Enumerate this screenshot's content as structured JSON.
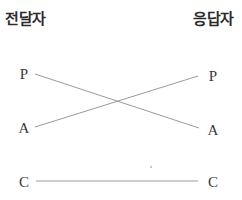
{
  "diagram": {
    "left_title": "전달자",
    "right_title": "응답자",
    "left_nodes": [
      {
        "label": "P",
        "x": 17,
        "y": 66
      },
      {
        "label": "A",
        "x": 17,
        "y": 120
      },
      {
        "label": "C",
        "x": 17,
        "y": 174
      }
    ],
    "right_nodes": [
      {
        "label": "P",
        "x": 206,
        "y": 68
      },
      {
        "label": "A",
        "x": 206,
        "y": 122
      },
      {
        "label": "C",
        "x": 206,
        "y": 174
      }
    ],
    "links": [
      {
        "from": "P",
        "to": "A",
        "x1": 35,
        "y1": 74,
        "x2": 199,
        "y2": 128
      },
      {
        "from": "A",
        "to": "P",
        "x1": 35,
        "y1": 127,
        "x2": 198,
        "y2": 76
      },
      {
        "from": "C",
        "to": "C",
        "x1": 36,
        "y1": 181,
        "x2": 198,
        "y2": 181
      }
    ],
    "line_color": "#9a9a9a"
  }
}
